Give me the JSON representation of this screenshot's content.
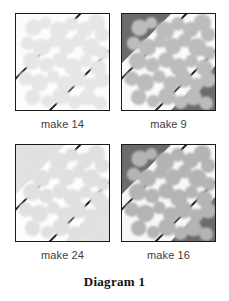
{
  "figure": {
    "title": "Diagram 1",
    "panel_count": 4
  },
  "panels": [
    {
      "id": "panel-1",
      "caption": "make 14",
      "position": "top-left",
      "corner_fill": "#fcfcfc",
      "band_fill": "#fdfdfd",
      "blob_color": "#e6e6e6",
      "border_color": "#1a1a1a",
      "band_line_color": "#1a1a1a",
      "contrast": "very-low"
    },
    {
      "id": "panel-2",
      "caption": "make 9",
      "position": "top-right",
      "corner_fill": "#6b6b6b",
      "band_fill": "#fafafa",
      "blob_color": "#bcbcbc",
      "border_color": "#1a1a1a",
      "band_line_color": "#1a1a1a",
      "contrast": "high"
    },
    {
      "id": "panel-3",
      "caption": "make 24",
      "position": "bottom-left",
      "corner_fill": "#e2e2e2",
      "band_fill": "#fdfdfd",
      "blob_color": "#e0e0e0",
      "border_color": "#1a1a1a",
      "band_line_color": "#1a1a1a",
      "contrast": "low"
    },
    {
      "id": "panel-4",
      "caption": "make 16",
      "position": "bottom-right",
      "corner_fill": "#6b6b6b",
      "band_fill": "#f7f7f7",
      "blob_color": "#b4b4b4",
      "border_color": "#1a1a1a",
      "band_line_color": "#1a1a1a",
      "contrast": "high"
    }
  ],
  "blob_shapes": [
    {
      "cx": 18,
      "cy": 14,
      "r": 8.5
    },
    {
      "cx": 30,
      "cy": 9,
      "r": 6.0
    },
    {
      "cx": 44,
      "cy": 17,
      "r": 9.5
    },
    {
      "cx": 57,
      "cy": 10,
      "r": 7.0
    },
    {
      "cx": 70,
      "cy": 16,
      "r": 8.0
    },
    {
      "cx": 82,
      "cy": 9,
      "r": 9.0
    },
    {
      "cx": 88,
      "cy": 21,
      "r": 7.5
    },
    {
      "cx": 12,
      "cy": 30,
      "r": 7.0
    },
    {
      "cx": 26,
      "cy": 34,
      "r": 9.0
    },
    {
      "cx": 39,
      "cy": 28,
      "r": 6.5
    },
    {
      "cx": 52,
      "cy": 33,
      "r": 8.5
    },
    {
      "cx": 64,
      "cy": 27,
      "r": 7.0
    },
    {
      "cx": 77,
      "cy": 34,
      "r": 9.5
    },
    {
      "cx": 89,
      "cy": 40,
      "r": 7.0
    },
    {
      "cx": 16,
      "cy": 48,
      "r": 9.0
    },
    {
      "cx": 31,
      "cy": 52,
      "r": 7.5
    },
    {
      "cx": 45,
      "cy": 47,
      "r": 8.0
    },
    {
      "cx": 58,
      "cy": 54,
      "r": 9.0
    },
    {
      "cx": 71,
      "cy": 48,
      "r": 6.5
    },
    {
      "cx": 84,
      "cy": 55,
      "r": 8.5
    },
    {
      "cx": 10,
      "cy": 66,
      "r": 7.5
    },
    {
      "cx": 24,
      "cy": 70,
      "r": 9.0
    },
    {
      "cx": 38,
      "cy": 64,
      "r": 6.5
    },
    {
      "cx": 50,
      "cy": 71,
      "r": 8.0
    },
    {
      "cx": 63,
      "cy": 66,
      "r": 9.0
    },
    {
      "cx": 76,
      "cy": 72,
      "r": 7.0
    },
    {
      "cx": 88,
      "cy": 67,
      "r": 8.0
    },
    {
      "cx": 17,
      "cy": 85,
      "r": 8.0
    },
    {
      "cx": 32,
      "cy": 89,
      "r": 6.5
    },
    {
      "cx": 46,
      "cy": 84,
      "r": 9.0
    },
    {
      "cx": 60,
      "cy": 90,
      "r": 7.0
    },
    {
      "cx": 73,
      "cy": 85,
      "r": 8.5
    },
    {
      "cx": 86,
      "cy": 91,
      "r": 7.0
    }
  ]
}
